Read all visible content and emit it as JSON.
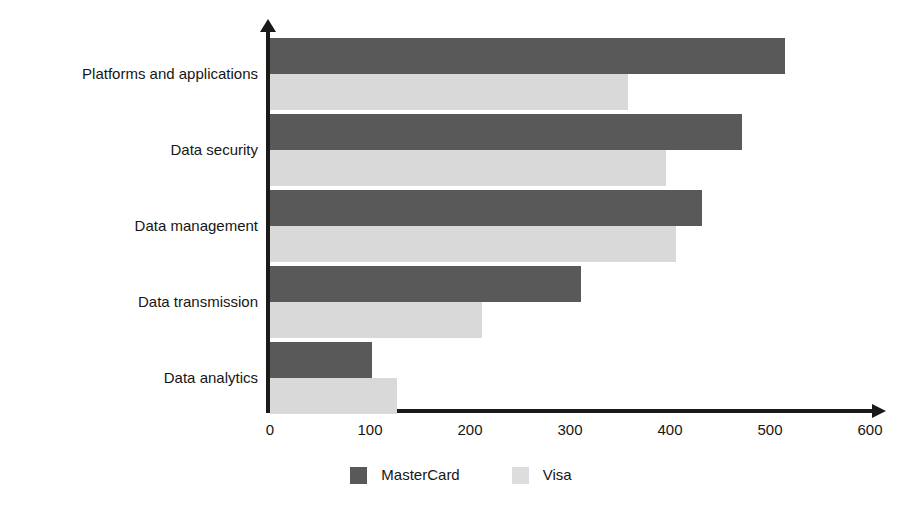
{
  "chart_data": {
    "type": "bar",
    "orientation": "horizontal",
    "title": "",
    "subtitle": "",
    "xlabel": "",
    "ylabel": "",
    "categories": [
      "Platforms and applications",
      "Data security",
      "Data management",
      "Data transmission",
      "Data analytics"
    ],
    "series": [
      {
        "name": "MasterCard",
        "color": "#595959",
        "values": [
          515,
          472,
          432,
          311,
          102
        ]
      },
      {
        "name": "Visa",
        "color": "#d9d9d9",
        "values": [
          358,
          396,
          406,
          212,
          127
        ]
      }
    ],
    "xlim": [
      0,
      600
    ],
    "xticks": [
      0,
      100,
      200,
      300,
      400,
      500,
      600
    ],
    "xtick_labels": [
      "0",
      "100",
      "200",
      "300",
      "400",
      "500",
      "600"
    ],
    "grid": false,
    "legend_position": "bottom",
    "legend": [
      {
        "label": "MasterCard",
        "swatch": "dark"
      },
      {
        "label": "Visa",
        "swatch": "light"
      }
    ],
    "axis_color": "#1a1a1a",
    "background": "#ffffff"
  }
}
